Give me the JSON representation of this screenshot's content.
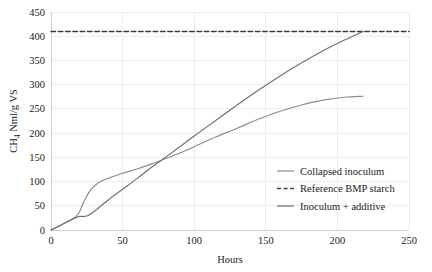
{
  "chart_data": {
    "type": "line",
    "title": "",
    "xlabel": "Hours",
    "ylabel": "CH4 Nml/g VS",
    "ylabel_display": "CH",
    "ylabel_sub": "4",
    "ylabel_rest": " Nml/g VS",
    "xlim": [
      0,
      250
    ],
    "ylim": [
      0,
      450
    ],
    "xticks": [
      0,
      50,
      100,
      150,
      200,
      250
    ],
    "yticks": [
      0,
      50,
      100,
      150,
      200,
      250,
      300,
      350,
      400,
      450
    ],
    "xtick_labels": [
      "0",
      "50",
      "100",
      "150",
      "200",
      "250"
    ],
    "ytick_labels": [
      "0",
      "50",
      "100",
      "150",
      "200",
      "250",
      "300",
      "350",
      "400",
      "450"
    ],
    "grid": true,
    "grid_color": "#e9e9ec",
    "legend_position": "inside-lower-right",
    "series": [
      {
        "name": "Collapsed inoculum",
        "style": "solid",
        "color": "#8a8a92",
        "x": [
          0,
          5,
          10,
          15,
          18,
          20,
          22,
          25,
          28,
          32,
          36,
          40,
          45,
          50,
          60,
          70,
          78,
          90,
          100,
          115,
          130,
          145,
          160,
          175,
          190,
          205,
          218
        ],
        "y": [
          0,
          7,
          15,
          23,
          29,
          38,
          52,
          70,
          84,
          95,
          102,
          107,
          112,
          117,
          126,
          136,
          145,
          159,
          172,
          192,
          210,
          229,
          245,
          258,
          268,
          274,
          276
        ]
      },
      {
        "name": "Reference BMP starch",
        "style": "dashed",
        "color": "#3c3c3c",
        "x": [
          0,
          250
        ],
        "y": [
          410,
          410
        ]
      },
      {
        "name": "Inoculum + additive",
        "style": "solid",
        "color": "#6e6e76",
        "x": [
          0,
          5,
          10,
          15,
          18,
          20,
          23,
          26,
          30,
          35,
          40,
          50,
          60,
          70,
          78,
          90,
          100,
          115,
          130,
          145,
          160,
          175,
          190,
          205,
          218
        ],
        "y": [
          0,
          7,
          15,
          22,
          26,
          28,
          28,
          30,
          38,
          50,
          62,
          84,
          106,
          129,
          146,
          172,
          194,
          226,
          258,
          289,
          318,
          345,
          370,
          392,
          410
        ]
      }
    ],
    "legend": [
      {
        "label": "Collapsed inoculum",
        "style": "solid",
        "color": "#8a8a92"
      },
      {
        "label": "Reference BMP starch",
        "style": "dashed",
        "color": "#3c3c3c"
      },
      {
        "label": "Inoculum + additive",
        "style": "solid",
        "color": "#6e6e76"
      }
    ]
  }
}
